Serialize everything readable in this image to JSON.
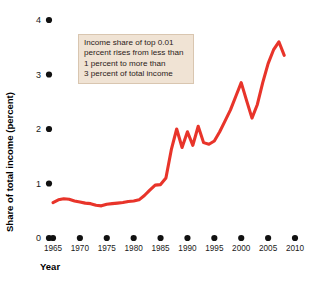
{
  "chart_data": {
    "type": "line",
    "title": "",
    "xlabel": "Year",
    "ylabel": "Share of total income (percent)",
    "xlim": [
      1965,
      2010
    ],
    "ylim": [
      0,
      4
    ],
    "grid": false,
    "legend": "none",
    "line_color": "#e8342a",
    "annotation_bg": "#f0e3d4",
    "annotation_border": "#d9c6b0",
    "x_tick_labels": [
      "1965",
      "1970",
      "1975",
      "1980",
      "1985",
      "1990",
      "1995",
      "2000",
      "2005",
      "2010"
    ],
    "x_ticks": [
      1965,
      1970,
      1975,
      1980,
      1985,
      1990,
      1995,
      2000,
      2005,
      2010
    ],
    "y_tick_labels": [
      "0",
      "1",
      "2",
      "3",
      "4"
    ],
    "y_ticks": [
      0,
      1,
      2,
      3,
      4
    ],
    "annotation": {
      "lines": [
        "Income share of top 0.01",
        "percent rises from less than",
        "1 percent to more than",
        "3 percent of total income"
      ]
    },
    "series": [
      {
        "name": "Income share of top 0.01 percent",
        "x": [
          1965,
          1966,
          1967,
          1968,
          1969,
          1970,
          1971,
          1972,
          1973,
          1974,
          1975,
          1976,
          1977,
          1978,
          1979,
          1980,
          1981,
          1982,
          1983,
          1984,
          1985,
          1986,
          1987,
          1988,
          1989,
          1990,
          1991,
          1992,
          1993,
          1994,
          1995,
          1996,
          1997,
          1998,
          1999,
          2000,
          2001,
          2002,
          2003,
          2004,
          2005,
          2006,
          2007,
          2008
        ],
        "values": [
          0.65,
          0.7,
          0.72,
          0.71,
          0.68,
          0.66,
          0.64,
          0.63,
          0.6,
          0.59,
          0.62,
          0.63,
          0.64,
          0.65,
          0.67,
          0.68,
          0.7,
          0.78,
          0.88,
          0.97,
          0.98,
          1.1,
          1.62,
          2.0,
          1.66,
          1.95,
          1.7,
          2.05,
          1.75,
          1.72,
          1.78,
          1.95,
          2.15,
          2.35,
          2.6,
          2.85,
          2.52,
          2.2,
          2.45,
          2.85,
          3.2,
          3.45,
          3.6,
          3.35
        ]
      }
    ]
  },
  "axes": {
    "y_axis_title": "Share of total income (percent)",
    "x_axis_title": "Year"
  }
}
